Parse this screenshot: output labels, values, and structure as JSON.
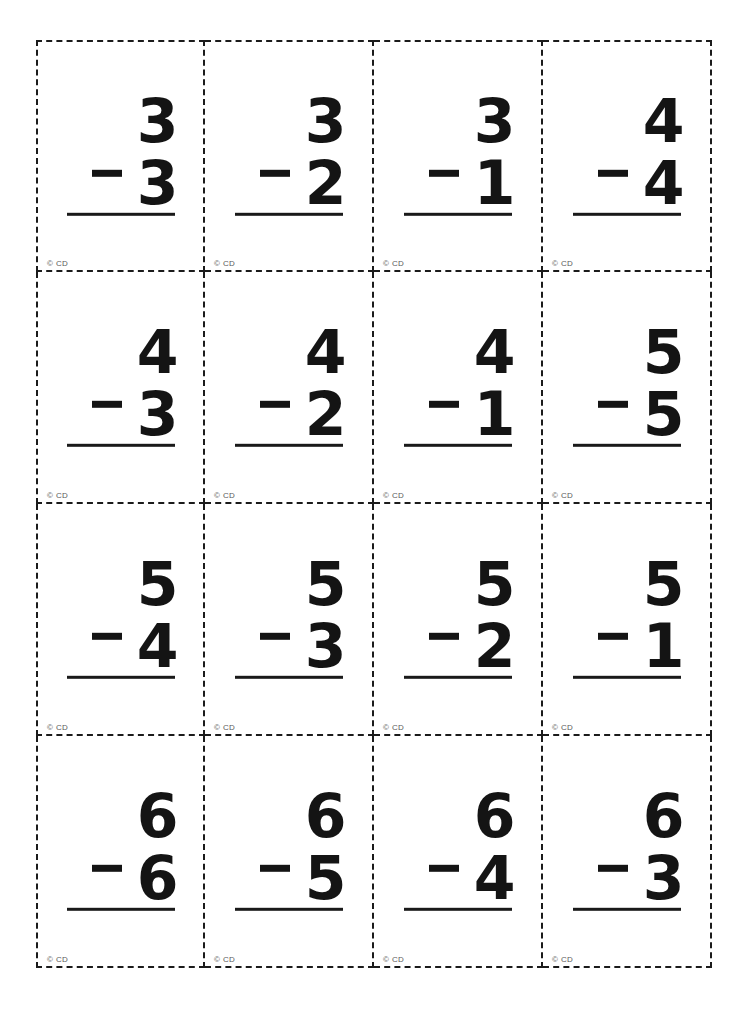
{
  "page": {
    "background_color": "#ffffff",
    "ink_color": "#141414",
    "cut_line_color": "#1b1b1b",
    "copyright_color": "#5a5a5a"
  },
  "grid": {
    "columns": 4,
    "rows": 4,
    "card_count": 16,
    "cut_line_style": "dashed"
  },
  "card_defaults": {
    "operator": "−",
    "copyright": "© CD"
  },
  "cards": [
    {
      "minuend": "3",
      "operator": "−",
      "subtrahend": "3",
      "copyright": "© CD"
    },
    {
      "minuend": "3",
      "operator": "−",
      "subtrahend": "2",
      "copyright": "© CD"
    },
    {
      "minuend": "3",
      "operator": "−",
      "subtrahend": "1",
      "copyright": "© CD"
    },
    {
      "minuend": "4",
      "operator": "−",
      "subtrahend": "4",
      "copyright": "© CD"
    },
    {
      "minuend": "4",
      "operator": "−",
      "subtrahend": "3",
      "copyright": "© CD"
    },
    {
      "minuend": "4",
      "operator": "−",
      "subtrahend": "2",
      "copyright": "© CD"
    },
    {
      "minuend": "4",
      "operator": "−",
      "subtrahend": "1",
      "copyright": "© CD"
    },
    {
      "minuend": "5",
      "operator": "−",
      "subtrahend": "5",
      "copyright": "© CD"
    },
    {
      "minuend": "5",
      "operator": "−",
      "subtrahend": "4",
      "copyright": "© CD"
    },
    {
      "minuend": "5",
      "operator": "−",
      "subtrahend": "3",
      "copyright": "© CD"
    },
    {
      "minuend": "5",
      "operator": "−",
      "subtrahend": "2",
      "copyright": "© CD"
    },
    {
      "minuend": "5",
      "operator": "−",
      "subtrahend": "1",
      "copyright": "© CD"
    },
    {
      "minuend": "6",
      "operator": "−",
      "subtrahend": "6",
      "copyright": "© CD"
    },
    {
      "minuend": "6",
      "operator": "−",
      "subtrahend": "5",
      "copyright": "© CD"
    },
    {
      "minuend": "6",
      "operator": "−",
      "subtrahend": "4",
      "copyright": "© CD"
    },
    {
      "minuend": "6",
      "operator": "−",
      "subtrahend": "3",
      "copyright": "© CD"
    }
  ]
}
